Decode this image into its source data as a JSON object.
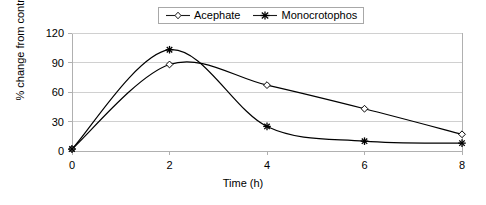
{
  "chart_data": {
    "type": "line",
    "title": "",
    "subtitle": "",
    "xlabel": "Time (h)",
    "ylabel": "% change from control",
    "x": [
      0,
      2,
      4,
      6,
      8
    ],
    "xtick_labels": [
      "0",
      "2",
      "4",
      "6",
      "8"
    ],
    "ytick_labels": [
      "0",
      "30",
      "60",
      "90",
      "120"
    ],
    "yticks": [
      0,
      30,
      60,
      90,
      120
    ],
    "xlim": [
      0,
      8
    ],
    "ylim": [
      0,
      120
    ],
    "grid": "horizontal",
    "legend_position": "top-center",
    "smoothing": "spline",
    "series": [
      {
        "name": "Acephate",
        "marker": "open-diamond",
        "color": "#000000",
        "values": [
          2,
          88,
          67,
          43,
          17
        ]
      },
      {
        "name": "Monocrotophos",
        "marker": "asterisk",
        "color": "#000000",
        "values": [
          2,
          103,
          25,
          10,
          8
        ]
      }
    ]
  },
  "legend": {
    "entries": [
      {
        "label": "Acephate"
      },
      {
        "label": "Monocrotophos"
      }
    ]
  },
  "axes": {
    "x_title": "Time (h)",
    "y_title": "% change from control"
  },
  "colors": {
    "line": "#1a1a1a",
    "frame": "#b0b0b0",
    "grid": "#d0d0d0",
    "background": "#ffffff"
  }
}
